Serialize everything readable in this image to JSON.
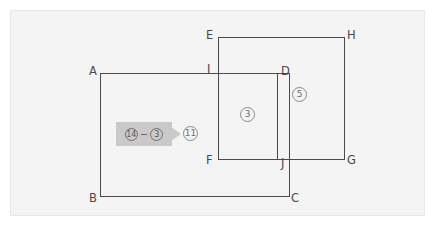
{
  "figure": {
    "background_color": "#f4f4f4",
    "line_color": "#4a4a4a",
    "callout_fill": "#c9c9c9",
    "vertices": [
      {
        "id": "A",
        "label": "A",
        "x": 89,
        "y": 66
      },
      {
        "id": "B",
        "label": "B",
        "x": 89,
        "y": 193
      },
      {
        "id": "C",
        "label": "C",
        "x": 291,
        "y": 193
      },
      {
        "id": "D",
        "label": "D",
        "x": 281,
        "y": 66
      },
      {
        "id": "E",
        "label": "E",
        "x": 206,
        "y": 30
      },
      {
        "id": "F",
        "label": "F",
        "x": 206,
        "y": 155
      },
      {
        "id": "G",
        "label": "G",
        "x": 347,
        "y": 155
      },
      {
        "id": "H",
        "label": "H",
        "x": 347,
        "y": 30
      },
      {
        "id": "I",
        "label": "I",
        "x": 207,
        "y": 64
      },
      {
        "id": "J",
        "label": "J",
        "x": 281,
        "y": 158
      }
    ],
    "region_labels": [
      {
        "id": "overlap",
        "label": "3",
        "x": 240,
        "y": 107
      },
      {
        "id": "upper-right",
        "label": "5",
        "x": 292,
        "y": 87
      }
    ],
    "callout": {
      "operand_left": "14",
      "operator": "−",
      "operand_right": "3",
      "result": "11"
    }
  }
}
